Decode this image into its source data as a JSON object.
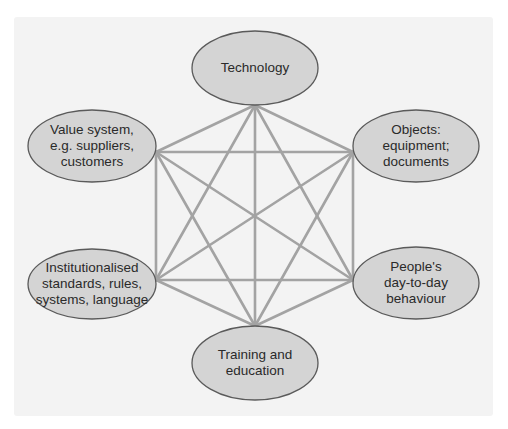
{
  "diagram": {
    "type": "complete-graph",
    "style": {
      "panel_color": "#f3f3f3",
      "node_fill": "#d4d4d4",
      "node_stroke": "#5a5a5a",
      "edge_color": "#a3a3a3"
    },
    "nodes": [
      {
        "id": "technology",
        "lines": [
          "Technology"
        ],
        "ellipse": {
          "cx": 255,
          "cy": 68,
          "rx": 63,
          "ry": 37
        },
        "anchor": {
          "x": 255,
          "y": 105
        }
      },
      {
        "id": "value-system",
        "lines": [
          "Value system,",
          "e.g. suppliers,",
          "customers"
        ],
        "ellipse": {
          "cx": 92,
          "cy": 146,
          "rx": 64,
          "ry": 36
        },
        "anchor": {
          "x": 156,
          "y": 152
        }
      },
      {
        "id": "objects",
        "lines": [
          "Objects:",
          "equipment;",
          "documents"
        ],
        "ellipse": {
          "cx": 416,
          "cy": 146,
          "rx": 63,
          "ry": 36
        },
        "anchor": {
          "x": 353,
          "y": 152
        }
      },
      {
        "id": "institutionalised",
        "lines": [
          "Institutionalised",
          "standards, rules,",
          "systems, language"
        ],
        "ellipse": {
          "cx": 92,
          "cy": 284,
          "rx": 64,
          "ry": 35
        },
        "anchor": {
          "x": 156,
          "y": 280
        }
      },
      {
        "id": "peoples-behaviour",
        "lines": [
          "People's",
          "day-to-day",
          "behaviour"
        ],
        "ellipse": {
          "cx": 416,
          "cy": 283,
          "rx": 63,
          "ry": 36
        },
        "anchor": {
          "x": 353,
          "y": 280
        }
      },
      {
        "id": "training",
        "lines": [
          "Training and",
          "education"
        ],
        "ellipse": {
          "cx": 255,
          "cy": 363,
          "rx": 63,
          "ry": 37
        },
        "anchor": {
          "x": 255,
          "y": 326
        }
      }
    ],
    "edges": "all-pairs"
  }
}
